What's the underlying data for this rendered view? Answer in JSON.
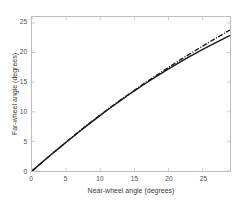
{
  "chart_data": {
    "type": "line",
    "title": "",
    "xlabel": "Near-wheel angle (degrees)",
    "ylabel": "Far-wheel angle (degrees)",
    "xlim": [
      0,
      29
    ],
    "ylim": [
      0,
      26
    ],
    "xticks": [
      0,
      5,
      10,
      15,
      20,
      25
    ],
    "yticks": [
      0,
      5,
      10,
      15,
      20,
      25
    ],
    "grid": false,
    "legend": null,
    "box": true,
    "series": [
      {
        "name": "Ackermann steering geometry",
        "style": "solid",
        "color": "#1a1a1a",
        "x": [
          0,
          1,
          2,
          3,
          4,
          5,
          6,
          7,
          8,
          9,
          10,
          11,
          12,
          13,
          14,
          15,
          16,
          17,
          18,
          19,
          20,
          21,
          22,
          23,
          24,
          25,
          26,
          27,
          28,
          29
        ],
        "y": [
          0,
          0.99,
          1.97,
          2.94,
          3.9,
          4.85,
          5.79,
          6.71,
          7.62,
          8.51,
          9.39,
          10.25,
          11.1,
          11.93,
          12.74,
          13.53,
          14.31,
          15.07,
          15.81,
          16.53,
          17.24,
          17.93,
          18.6,
          19.26,
          19.9,
          20.53,
          21.14,
          21.73,
          22.31,
          22.88
        ]
      },
      {
        "name": "Linear / approximate steering",
        "style": "dash-dot",
        "color": "#1a1a1a",
        "x": [
          0,
          1,
          2,
          3,
          4,
          5,
          6,
          7,
          8,
          9,
          10,
          11,
          12,
          13,
          14,
          15,
          16,
          17,
          18,
          19,
          20,
          21,
          22,
          23,
          24,
          25,
          26,
          27,
          28,
          29
        ],
        "y": [
          0,
          0.99,
          1.98,
          2.96,
          3.93,
          4.89,
          5.84,
          6.77,
          7.69,
          8.59,
          9.47,
          10.34,
          11.19,
          12.02,
          12.84,
          13.64,
          14.43,
          15.21,
          15.98,
          16.74,
          17.49,
          18.23,
          18.96,
          19.68,
          20.39,
          21.09,
          21.78,
          22.46,
          23.13,
          23.8
        ]
      }
    ]
  },
  "axes": {
    "xtick_labels": [
      "0",
      "5",
      "10",
      "15",
      "20",
      "25"
    ],
    "ytick_labels": [
      "0",
      "5",
      "10",
      "15",
      "20",
      "25"
    ]
  }
}
